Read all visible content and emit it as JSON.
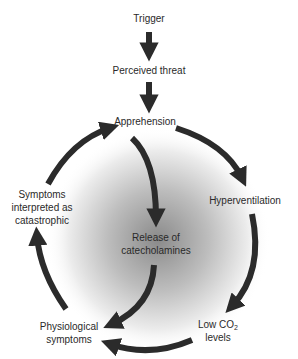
{
  "diagram": {
    "type": "cycle-flow",
    "colors": {
      "arrow": "#2b2b2b",
      "text": "#2a2a2a",
      "shade_center": "#8a8a8a",
      "background": "#ffffff"
    },
    "nodes": {
      "trigger": {
        "lines": [
          "Trigger"
        ]
      },
      "perceived_threat": {
        "lines": [
          "Perceived threat"
        ]
      },
      "apprehension": {
        "lines": [
          "Apprehension"
        ]
      },
      "hyperventilation": {
        "lines": [
          "Hyperventilation"
        ]
      },
      "low_co2": {
        "line1_prefix": "Low CO",
        "line1_sub": "2",
        "line2": "levels"
      },
      "physiological_symptoms": {
        "lines": [
          "Physiological",
          "symptoms"
        ]
      },
      "symptoms_interpreted": {
        "lines": [
          "Symptoms",
          "interpreted as",
          "catastrophic"
        ]
      },
      "release_catecholamines": {
        "lines": [
          "Release of",
          "catecholamines"
        ]
      }
    },
    "edges": [
      {
        "from": "Trigger",
        "to": "Perceived threat"
      },
      {
        "from": "Perceived threat",
        "to": "Apprehension"
      },
      {
        "from": "Apprehension",
        "to": "Hyperventilation"
      },
      {
        "from": "Hyperventilation",
        "to": "Low CO2 levels"
      },
      {
        "from": "Low CO2 levels",
        "to": "Physiological symptoms"
      },
      {
        "from": "Physiological symptoms",
        "to": "Symptoms interpreted as catastrophic"
      },
      {
        "from": "Symptoms interpreted as catastrophic",
        "to": "Apprehension"
      },
      {
        "from": "Apprehension",
        "to": "Release of catecholamines"
      },
      {
        "from": "Release of catecholamines",
        "to": "Physiological symptoms"
      }
    ]
  }
}
